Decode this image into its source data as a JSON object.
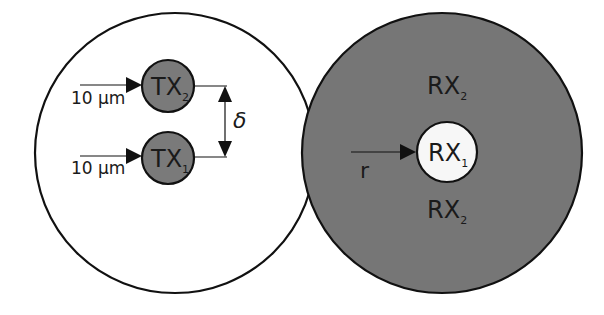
{
  "diagram": {
    "colors": {
      "background": "#ffffff",
      "stroke": "#111111",
      "tx_fill": "#7a7a7a",
      "rx2_fill": "#767676",
      "rx1_fill": "#f7f7f7",
      "outer_left_fill": "#ffffff"
    },
    "transmitter_panel": {
      "tx2": {
        "label": "TX",
        "sub": "2"
      },
      "tx1": {
        "label": "TX",
        "sub": "1"
      },
      "arrow_tx2_label": "10 μm",
      "arrow_tx1_label": "10 μm",
      "separation_label": "δ"
    },
    "receiver_panel": {
      "rx1": {
        "label": "RX",
        "sub": "1"
      },
      "rx2_top": {
        "label": "RX",
        "sub": "2"
      },
      "rx2_bottom": {
        "label": "RX",
        "sub": "2"
      },
      "radius_label": "r"
    }
  }
}
